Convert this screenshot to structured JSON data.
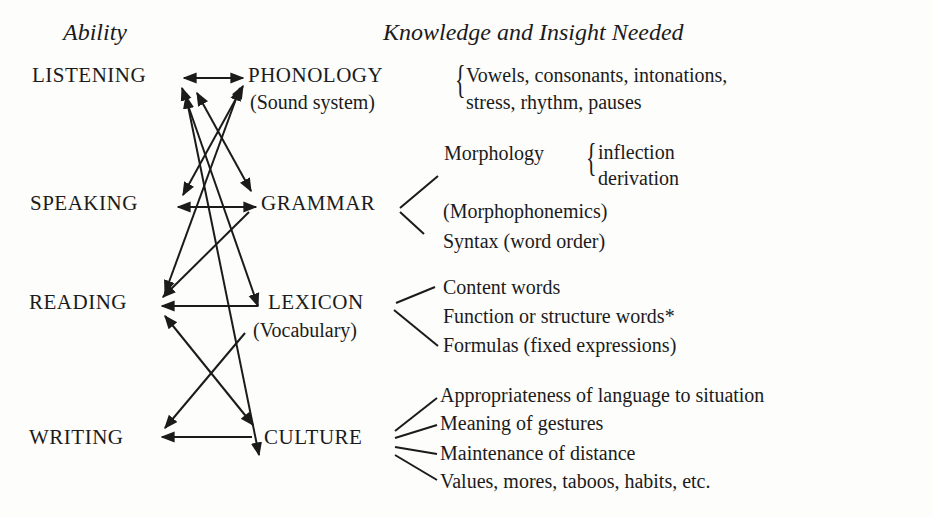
{
  "headers": {
    "ability": "Ability",
    "knowledge": "Knowledge and Insight Needed"
  },
  "abilities": [
    {
      "label": "LISTENING"
    },
    {
      "label": "SPEAKING"
    },
    {
      "label": "READING"
    },
    {
      "label": "WRITING"
    }
  ],
  "knowledge_areas": [
    {
      "label": "PHONOLOGY",
      "sub": "(Sound system)"
    },
    {
      "label": "GRAMMAR",
      "sub": ""
    },
    {
      "label": "LEXICON",
      "sub": "(Vocabulary)"
    },
    {
      "label": "CULTURE",
      "sub": ""
    }
  ],
  "phonology_details": {
    "lines": [
      "Vowels, consonants, intonations,",
      "stress, rhythm, pauses"
    ]
  },
  "grammar_details": {
    "morphology": {
      "label": "Morphology",
      "items": [
        "inflection",
        "derivation"
      ]
    },
    "morphophonemics": "(Morphophonemics)",
    "syntax": "Syntax (word order)"
  },
  "lexicon_details": {
    "items": [
      "Content words",
      "Function or structure words*",
      "Formulas (fixed expressions)"
    ]
  },
  "culture_details": {
    "items": [
      "Appropriateness of language to situation",
      "Meaning of gestures",
      "Maintenance of distance",
      "Values, mores, taboos, habits, etc."
    ]
  },
  "connections": [
    {
      "from": "LISTENING",
      "to": "PHONOLOGY",
      "bidirectional": true
    },
    {
      "from": "SPEAKING",
      "to": "GRAMMAR",
      "bidirectional": true
    },
    {
      "from": "LEXICON",
      "to": "READING",
      "bidirectional": false
    },
    {
      "from": "CULTURE",
      "to": "WRITING",
      "bidirectional": false
    },
    {
      "from": "PHONOLOGY",
      "to": "SPEAKING",
      "bidirectional": true
    },
    {
      "from": "LISTENING",
      "to": "GRAMMAR",
      "bidirectional": true
    },
    {
      "from": "GRAMMAR",
      "to": "READING",
      "bidirectional": false
    },
    {
      "from": "PHONOLOGY",
      "to": "READING",
      "bidirectional": true
    },
    {
      "from": "LISTENING",
      "to": "LEXICON",
      "bidirectional": true
    },
    {
      "from": "LISTENING",
      "to": "CULTURE",
      "bidirectional": true
    },
    {
      "from": "READING",
      "to": "CULTURE",
      "bidirectional": true
    },
    {
      "from": "LEXICON",
      "to": "WRITING",
      "bidirectional": false
    }
  ],
  "colors": {
    "ink": "#1b1b1b",
    "paper": "#fdfdfb"
  }
}
